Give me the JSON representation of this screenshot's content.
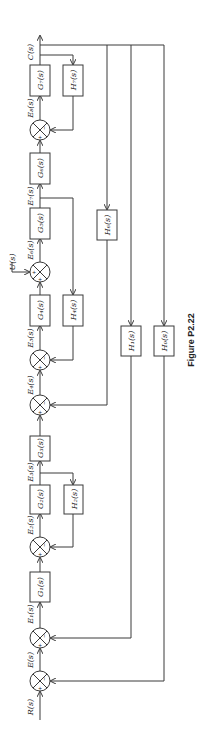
{
  "figure": {
    "caption": "Figure P2.22",
    "orientation": "rotated -90deg (signal flows bottom to top)",
    "input": "R(s)",
    "output": "C(s)",
    "disturbance": "U(s)"
  },
  "signals": {
    "R": "R(s)",
    "E": "E(s)",
    "E1": "E₁(s)",
    "E2": "E₂(s)",
    "E3": "E₃(s)",
    "E4": "E₄(s)",
    "E5": "E₅(s)",
    "E6": "E₆(s)",
    "E7": "E₇(s)",
    "E8": "E₈(s)",
    "C": "C(s)",
    "U": "U(s)"
  },
  "forward_blocks": [
    {
      "id": "G1",
      "label": "G₁(s)"
    },
    {
      "id": "G2",
      "label": "G₂(s)"
    },
    {
      "id": "G3",
      "label": "G₃(s)"
    },
    {
      "id": "G4",
      "label": "G₄(s)"
    },
    {
      "id": "G5",
      "label": "G₅(s)"
    },
    {
      "id": "G6",
      "label": "G₆(s)"
    },
    {
      "id": "G7",
      "label": "G₇(s)"
    }
  ],
  "feedback_blocks": [
    {
      "id": "H0",
      "label": "H₀(s)",
      "from": "C",
      "to": "E"
    },
    {
      "id": "H1",
      "label": "H₁(s)",
      "from": "C",
      "to": "E1"
    },
    {
      "id": "H2",
      "label": "H₂(s)",
      "from": "E3",
      "to": "E2"
    },
    {
      "id": "H4",
      "label": "H₄(s)",
      "from": "E7",
      "to": "E5"
    },
    {
      "id": "H6",
      "label": "H₆(s)",
      "from": "C",
      "to": "E4"
    },
    {
      "id": "H7",
      "label": "H₇(s)",
      "from": "C",
      "to": "E8"
    }
  ],
  "summing_junctions": [
    {
      "output": "E",
      "signs": [
        "+",
        "-"
      ]
    },
    {
      "output": "E1",
      "signs": [
        "+",
        "-"
      ]
    },
    {
      "output": "E2",
      "signs": [
        "+",
        "-"
      ]
    },
    {
      "output": "E4",
      "signs": [
        "+",
        "-"
      ]
    },
    {
      "output": "E5",
      "signs": [
        "+",
        "-"
      ]
    },
    {
      "output": "E6",
      "signs": [
        "+",
        "+"
      ]
    },
    {
      "output": "E8",
      "signs": [
        "+",
        "-"
      ]
    }
  ],
  "signs": {
    "plus": "+",
    "minus": "−"
  }
}
